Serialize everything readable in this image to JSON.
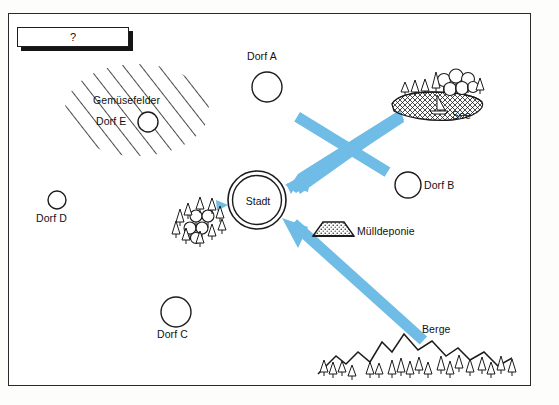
{
  "figure": {
    "title_box": {
      "text": "?",
      "name": "question-box"
    },
    "border_color": "#2b2b2b",
    "arrow_color": "#6FBCE6",
    "background": "#ffffff"
  },
  "map": {
    "center": {
      "label": "Stadt",
      "name": "city-node",
      "shape": "double-circle",
      "x": 257,
      "y": 200,
      "r": 29
    },
    "villages": [
      {
        "label": "Dorf A",
        "x": 267,
        "y": 87,
        "r": 15,
        "label_x": 247,
        "label_y": 57,
        "label_pos": "above"
      },
      {
        "label": "Dorf B",
        "x": 408,
        "y": 185,
        "r": 13,
        "label_x": 424,
        "label_y": 180,
        "label_pos": "right"
      },
      {
        "label": "Dorf C",
        "x": 176,
        "y": 312,
        "r": 15,
        "label_x": 157,
        "label_y": 333,
        "label_pos": "below"
      },
      {
        "label": "Dorf D",
        "x": 57,
        "y": 200,
        "r": 9,
        "label_x": 37,
        "label_y": 213,
        "label_pos": "below"
      },
      {
        "label": "Dorf E",
        "x": 148,
        "y": 122,
        "r": 10,
        "label_x": 96,
        "label_y": 116,
        "label_pos": "left"
      }
    ],
    "areas": [
      {
        "label": "Gemüsefelder",
        "name": "vegetable-fields",
        "pattern": "diagonal-hatch",
        "cx": 137,
        "cy": 110,
        "rx": 72,
        "ry": 46,
        "label_x": 95,
        "label_y": 98
      },
      {
        "label": "See",
        "name": "lake",
        "pattern": "cross-hatch-ellipse",
        "cx": 440,
        "cy": 103,
        "label_x": 453,
        "label_y": 113
      },
      {
        "label": "Mülldeponie",
        "name": "landfill",
        "pattern": "stippled-mound",
        "cx": 333,
        "cy": 230,
        "label_x": 357,
        "label_y": 231
      },
      {
        "label": "Berge",
        "name": "mountains",
        "pattern": "peaks-with-conifers",
        "label_x": 423,
        "label_y": 328
      }
    ],
    "forest": {
      "name": "forest",
      "x": 198,
      "y": 226,
      "label": ""
    },
    "arrows": [
      {
        "name": "arrow-lake-to-city",
        "from": "See",
        "to": "Stadt",
        "x1": 400,
        "y1": 114,
        "x2": 288,
        "y2": 186
      },
      {
        "name": "arrow-mountains-to-city",
        "from": "Berge",
        "to": "Stadt",
        "x1": 429,
        "y1": 348,
        "x2": 284,
        "y2": 222
      }
    ]
  }
}
